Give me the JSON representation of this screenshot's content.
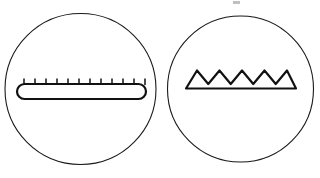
{
  "figure": {
    "title": "",
    "background_color": "#ffffff",
    "stroke_color": "#111111",
    "outline_color": "#1a1a1a",
    "width": 320,
    "height": 178,
    "panel_count": 2
  },
  "panels": [
    {
      "id": "left-panel",
      "name": "left-circle-panel",
      "shape": "circle",
      "center_x": 80.5,
      "center_y": 89,
      "radius": 75.5,
      "label": "",
      "content_name": "fine-toothed-bar",
      "content_description": "rounded bar with fine comb teeth",
      "bar": {
        "left_x": 17,
        "right_x": 146,
        "top_y": 84,
        "bottom_y": 99,
        "corner_radius": 7.5
      },
      "teeth": {
        "count": 12,
        "tick_top_y": 78.5,
        "tick_bottom_y": 84.5,
        "first_x": 24,
        "spacing": 11.0
      }
    },
    {
      "id": "right-panel",
      "name": "right-circle-panel",
      "shape": "circle",
      "center_x": 240.5,
      "center_y": 89,
      "radius": 73,
      "label": "",
      "content_name": "sawtooth-profile",
      "content_description": "zigzag sawtooth ridge on flat baseline",
      "baseline": {
        "left_x": 186,
        "right_x": 296,
        "y": 88.5
      },
      "sawtooth": {
        "peak_count": 5,
        "peak_y": 70.5,
        "valley_y": 84,
        "first_peak_x": 197,
        "peak_spacing": 22.5
      }
    }
  ],
  "artifacts": [
    {
      "name": "scan-smudge",
      "x": 233,
      "y": 1,
      "width": 7,
      "height": 3
    }
  ]
}
